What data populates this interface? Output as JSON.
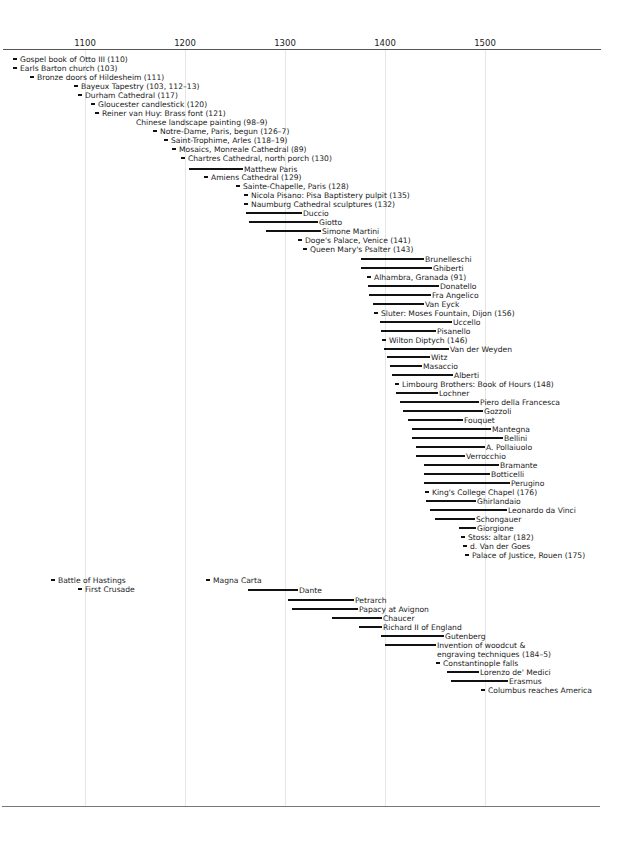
{
  "chart_data": {
    "type": "timeline",
    "title": "",
    "xlabel": "",
    "ylabel": "",
    "xlim": [
      1015,
      1615
    ],
    "x_ticks": [
      1100,
      1200,
      1300,
      1400,
      1500
    ],
    "grid": true,
    "legend": null,
    "scale": {
      "px_per_year": 1.0,
      "x_at_1100": 85
    },
    "art_events": [
      {
        "label": "Gospel book of Otto III (110)",
        "kind": "point",
        "start": 928,
        "x": 13,
        "y": 59
      },
      {
        "label": "Earls Barton church (103)",
        "kind": "point",
        "start": 928,
        "x": 13,
        "y": 68
      },
      {
        "label": "Bronze doors of Hildesheim (111)",
        "kind": "point",
        "start": 1015,
        "x": 30,
        "y": 77
      },
      {
        "label": "Bayeux Tapestry (103, 112–13)",
        "kind": "point",
        "start": 1073,
        "x": 74,
        "y": 86
      },
      {
        "label": "Durham Cathedral (117)",
        "kind": "point",
        "start": 1093,
        "x": 78,
        "y": 95
      },
      {
        "label": "Gloucester candlestick (120)",
        "kind": "point",
        "start": 1106,
        "x": 91,
        "y": 104
      },
      {
        "label": "Reiner van Huy: Brass font (121)",
        "kind": "point",
        "start": 1110,
        "x": 95,
        "y": 113
      },
      {
        "label": "Chinese landscape painting (98–9)",
        "kind": "text",
        "start": 1136,
        "x": 136,
        "y": 122
      },
      {
        "label": "Notre-Dame, Paris, begun (126–7)",
        "kind": "point",
        "start": 1163,
        "x": 153,
        "y": 131
      },
      {
        "label": "Saint-Trophime, Arles (118–19)",
        "kind": "point",
        "start": 1170,
        "x": 164,
        "y": 140
      },
      {
        "label": "Mosaics, Monreale Cathedral (89)",
        "kind": "point",
        "start": 1180,
        "x": 172,
        "y": 149
      },
      {
        "label": "Chartres Cathedral, north porch (130)",
        "kind": "point",
        "start": 1194,
        "x": 181,
        "y": 158
      },
      {
        "label": "Matthew Paris",
        "kind": "span",
        "start": 1200,
        "end": 1259,
        "x": 189,
        "x2": 243,
        "y": 169
      },
      {
        "label": "Amiens Cathedral (129)",
        "kind": "point",
        "start": 1220,
        "x": 204,
        "y": 177
      },
      {
        "label": "Sainte-Chapelle, Paris (128)",
        "kind": "point",
        "start": 1243,
        "x": 236,
        "y": 186
      },
      {
        "label": "Nicola Pisano: Pisa Baptistery pulpit (135)",
        "kind": "point",
        "start": 1260,
        "x": 244,
        "y": 195
      },
      {
        "label": "Naumburg Cathedral sculptures (132)",
        "kind": "point",
        "start": 1250,
        "x": 244,
        "y": 204
      },
      {
        "label": "Duccio",
        "kind": "span",
        "start": 1255,
        "end": 1319,
        "x": 246,
        "x2": 302,
        "y": 213
      },
      {
        "label": "Giotto",
        "kind": "span",
        "start": 1267,
        "end": 1337,
        "x": 249,
        "x2": 318,
        "y": 222
      },
      {
        "label": "Simone Martini",
        "kind": "span",
        "start": 1284,
        "end": 1344,
        "x": 266,
        "x2": 321,
        "y": 231
      },
      {
        "label": "Doge's Palace, Venice (141)",
        "kind": "point",
        "start": 1340,
        "x": 298,
        "y": 240
      },
      {
        "label": "Queen Mary's Psalter (143)",
        "kind": "point",
        "start": 1310,
        "x": 303,
        "y": 249
      },
      {
        "label": "Brunelleschi",
        "kind": "span",
        "start": 1377,
        "end": 1446,
        "x": 361,
        "x2": 424,
        "y": 259
      },
      {
        "label": "Ghiberti",
        "kind": "span",
        "start": 1378,
        "end": 1455,
        "x": 361,
        "x2": 432,
        "y": 268
      },
      {
        "label": "Alhambra, Granada (91)",
        "kind": "point",
        "start": 1377,
        "x": 367,
        "y": 277
      },
      {
        "label": "Donatello",
        "kind": "span",
        "start": 1386,
        "end": 1466,
        "x": 368,
        "x2": 439,
        "y": 286
      },
      {
        "label": "Fra Angelico",
        "kind": "span",
        "start": 1387,
        "end": 1455,
        "x": 369,
        "x2": 431,
        "y": 295
      },
      {
        "label": "Van Eyck",
        "kind": "span",
        "start": 1390,
        "end": 1441,
        "x": 373,
        "x2": 424,
        "y": 304
      },
      {
        "label": "Sluter: Moses Fountain, Dijon (156)",
        "kind": "point",
        "start": 1395,
        "x": 374,
        "y": 313
      },
      {
        "label": "Uccello",
        "kind": "span",
        "start": 1397,
        "end": 1475,
        "x": 380,
        "x2": 452,
        "y": 322
      },
      {
        "label": "Pisanello",
        "kind": "span",
        "start": 1395,
        "end": 1455,
        "x": 381,
        "x2": 436,
        "y": 331
      },
      {
        "label": "Wilton Diptych (146)",
        "kind": "point",
        "start": 1395,
        "x": 382,
        "y": 340
      },
      {
        "label": "Van der Weyden",
        "kind": "span",
        "start": 1399,
        "end": 1464,
        "x": 384,
        "x2": 449,
        "y": 349
      },
      {
        "label": "Witz",
        "kind": "span",
        "start": 1400,
        "end": 1446,
        "x": 387,
        "x2": 430,
        "y": 357
      },
      {
        "label": "Masaccio",
        "kind": "span",
        "start": 1401,
        "end": 1428,
        "x": 390,
        "x2": 422,
        "y": 366
      },
      {
        "label": "Alberti",
        "kind": "span",
        "start": 1404,
        "end": 1472,
        "x": 392,
        "x2": 453,
        "y": 375
      },
      {
        "label": "Limbourg Brothers: Book of Hours (148)",
        "kind": "point",
        "start": 1413,
        "x": 395,
        "y": 384
      },
      {
        "label": "Lochner",
        "kind": "span",
        "start": 1410,
        "end": 1451,
        "x": 396,
        "x2": 438,
        "y": 393
      },
      {
        "label": "Piero della Francesca",
        "kind": "span",
        "start": 1415,
        "end": 1492,
        "x": 400,
        "x2": 479,
        "y": 402
      },
      {
        "label": "Gozzoli",
        "kind": "span",
        "start": 1420,
        "end": 1497,
        "x": 403,
        "x2": 483,
        "y": 411
      },
      {
        "label": "Fouquet",
        "kind": "span",
        "start": 1420,
        "end": 1480,
        "x": 408,
        "x2": 463,
        "y": 420
      },
      {
        "label": "Mantegna",
        "kind": "span",
        "start": 1431,
        "end": 1506,
        "x": 412,
        "x2": 491,
        "y": 429
      },
      {
        "label": "Bellini",
        "kind": "span",
        "start": 1430,
        "end": 1516,
        "x": 412,
        "x2": 503,
        "y": 438
      },
      {
        "label": "A. Pollaiuolo",
        "kind": "span",
        "start": 1432,
        "end": 1498,
        "x": 416,
        "x2": 485,
        "y": 447
      },
      {
        "label": "Verrocchio",
        "kind": "span",
        "start": 1435,
        "end": 1488,
        "x": 416,
        "x2": 465,
        "y": 456
      },
      {
        "label": "Bramante",
        "kind": "span",
        "start": 1444,
        "end": 1514,
        "x": 424,
        "x2": 499,
        "y": 465
      },
      {
        "label": "Botticelli",
        "kind": "span",
        "start": 1445,
        "end": 1510,
        "x": 424,
        "x2": 490,
        "y": 474
      },
      {
        "label": "Perugino",
        "kind": "span",
        "start": 1445,
        "end": 1523,
        "x": 424,
        "x2": 510,
        "y": 483
      },
      {
        "label": "King's College Chapel (176)",
        "kind": "point",
        "start": 1446,
        "x": 425,
        "y": 492
      },
      {
        "label": "Ghirlandaio",
        "kind": "span",
        "start": 1449,
        "end": 1494,
        "x": 426,
        "x2": 476,
        "y": 501
      },
      {
        "label": "Leonardo da Vinci",
        "kind": "span",
        "start": 1452,
        "end": 1519,
        "x": 430,
        "x2": 507,
        "y": 510
      },
      {
        "label": "Schongauer",
        "kind": "span",
        "start": 1450,
        "end": 1491,
        "x": 435,
        "x2": 475,
        "y": 519
      },
      {
        "label": "Giorgione",
        "kind": "span",
        "start": 1477,
        "end": 1510,
        "x": 459,
        "x2": 476,
        "y": 528
      },
      {
        "label": "Stoss: altar (182)",
        "kind": "point",
        "start": 1477,
        "x": 461,
        "y": 537
      },
      {
        "label": "d. Van der Goes",
        "kind": "point",
        "start": 1482,
        "x": 463,
        "y": 546
      },
      {
        "label": "Palace of Justice, Rouen (175)",
        "kind": "point",
        "start": 1493,
        "x": 465,
        "y": 555
      }
    ],
    "history_events": [
      {
        "label": "Battle of Hastings",
        "kind": "point",
        "start": 1066,
        "x": 51,
        "y": 580
      },
      {
        "label": "First Crusade",
        "kind": "point",
        "start": 1096,
        "x": 78,
        "y": 589
      },
      {
        "label": "Magna Carta",
        "kind": "point",
        "start": 1215,
        "x": 206,
        "y": 580
      },
      {
        "label": "Dante",
        "kind": "span",
        "start": 1265,
        "end": 1321,
        "x": 248,
        "x2": 298,
        "y": 590
      },
      {
        "label": "Petrarch",
        "kind": "span",
        "start": 1304,
        "end": 1374,
        "x": 288,
        "x2": 354,
        "y": 600
      },
      {
        "label": "Papacy at Avignon",
        "kind": "span",
        "start": 1309,
        "end": 1377,
        "x": 292,
        "x2": 358,
        "y": 609
      },
      {
        "label": "Chaucer",
        "kind": "span",
        "start": 1343,
        "end": 1400,
        "x": 332,
        "x2": 382,
        "y": 618
      },
      {
        "label": "Richard II of England",
        "kind": "span",
        "start": 1377,
        "end": 1399,
        "x": 359,
        "x2": 382,
        "y": 627
      },
      {
        "label": "Gutenberg",
        "kind": "span",
        "start": 1398,
        "end": 1468,
        "x": 381,
        "x2": 444,
        "y": 636
      },
      {
        "label": "Invention of woodcut & engraving techniques (184–5)",
        "kind": "span",
        "start": 1400,
        "end": 1455,
        "x": 385,
        "x2": 436,
        "y": 645
      },
      {
        "label": "Constantinople falls",
        "kind": "point",
        "start": 1453,
        "x": 436,
        "y": 663
      },
      {
        "label": "Lorenzo de' Medici",
        "kind": "span",
        "start": 1449,
        "end": 1492,
        "x": 447,
        "x2": 479,
        "y": 672
      },
      {
        "label": "Erasmus",
        "kind": "span",
        "start": 1466,
        "end": 1536,
        "x": 451,
        "x2": 508,
        "y": 681
      },
      {
        "label": "Columbus reaches America",
        "kind": "point",
        "start": 1492,
        "x": 481,
        "y": 690
      }
    ]
  },
  "axis": {
    "ticks": [
      {
        "label": "1100",
        "x": 85
      },
      {
        "label": "1200",
        "x": 185
      },
      {
        "label": "1300",
        "x": 285
      },
      {
        "label": "1400",
        "x": 385
      },
      {
        "label": "1500",
        "x": 485
      }
    ]
  },
  "colors": {
    "bar": "#111111",
    "grid": "#e6e6e6",
    "axis": "#555555",
    "background": "#ffffff"
  }
}
